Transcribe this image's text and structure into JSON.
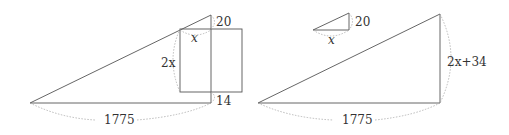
{
  "left_figure": {
    "labels": {
      "top_gap": "20",
      "square_width": "x",
      "square_height": "2x",
      "bottom_gap": "14",
      "base": "1775"
    }
  },
  "right_figure": {
    "small_triangle": {
      "height": "20",
      "base": "x"
    },
    "large_triangle": {
      "height": "2x+34",
      "base": "1775"
    }
  }
}
